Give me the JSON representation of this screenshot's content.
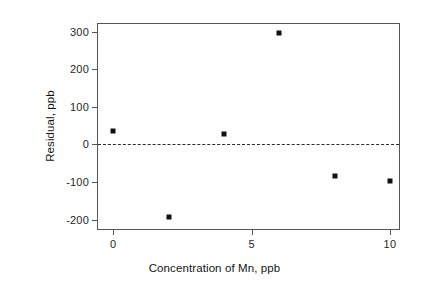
{
  "chart_data": {
    "type": "scatter",
    "title": "",
    "xlabel": "Concentration of Mn, ppb",
    "ylabel": "Residual, ppb",
    "x": [
      0,
      2,
      4,
      6,
      8,
      10
    ],
    "values": [
      37,
      -192,
      29,
      297,
      -84,
      -97
    ],
    "points": [
      {
        "x": 0,
        "y": 37
      },
      {
        "x": 2,
        "y": -192
      },
      {
        "x": 4,
        "y": 29
      },
      {
        "x": 6,
        "y": 297
      },
      {
        "x": 8,
        "y": -84
      },
      {
        "x": 10,
        "y": -97
      }
    ],
    "xlim": [
      -0.55,
      10.4
    ],
    "ylim": [
      -230,
      320
    ],
    "xticks": [
      0,
      5,
      10
    ],
    "xtick_labels": [
      "0",
      "5",
      "10"
    ],
    "yticks": [
      -200,
      -100,
      0,
      100,
      200,
      300
    ],
    "ytick_labels": [
      "-200",
      "-100",
      "0",
      "100",
      "200",
      "300"
    ],
    "grid": false,
    "legend": null,
    "annotations": [
      {
        "name": "zero-reference-line",
        "type": "hline",
        "y": 0,
        "style": "dashed",
        "color": "#2b2b2b"
      }
    ],
    "marker": {
      "shape": "square",
      "filled": true,
      "color": "#111111",
      "size_px": 5
    },
    "colors": {
      "marker": "#111111",
      "frame": "#555555",
      "zero_line": "#2b2b2b",
      "text": "#1a1a1a",
      "background": "#ffffff"
    }
  }
}
